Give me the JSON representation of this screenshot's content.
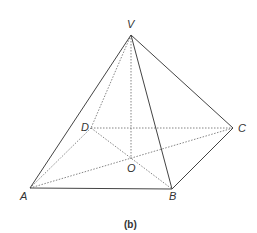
{
  "figure": {
    "caption": "(b)",
    "points": {
      "V": {
        "label": "V",
        "x": 131,
        "y": 35
      },
      "A": {
        "label": "A",
        "x": 30,
        "y": 188
      },
      "B": {
        "label": "B",
        "x": 172,
        "y": 189
      },
      "C": {
        "label": "C",
        "x": 233,
        "y": 128
      },
      "D": {
        "label": "D",
        "x": 91,
        "y": 128
      },
      "O": {
        "label": "O",
        "x": 131,
        "y": 159
      }
    },
    "solid_edges": [
      [
        "V",
        "A"
      ],
      [
        "V",
        "B"
      ],
      [
        "V",
        "C"
      ],
      [
        "A",
        "B"
      ],
      [
        "B",
        "C"
      ]
    ],
    "hidden_edges": [
      [
        "V",
        "D"
      ],
      [
        "V",
        "O"
      ],
      [
        "A",
        "D"
      ],
      [
        "D",
        "C"
      ],
      [
        "A",
        "C"
      ],
      [
        "D",
        "B"
      ]
    ],
    "colors": {
      "line": "#444444",
      "hidden": "#666666",
      "text": "#333333"
    }
  }
}
